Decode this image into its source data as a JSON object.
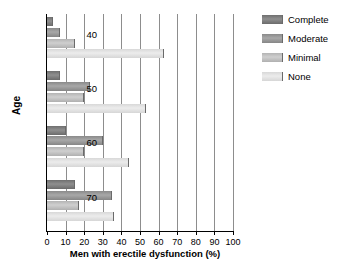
{
  "chart_data": {
    "type": "bar",
    "orientation": "horizontal",
    "title": "",
    "xlabel": "Men with erectile dysfunction (%)",
    "ylabel": "Age",
    "categories": [
      "40",
      "50",
      "60",
      "70"
    ],
    "xlim": [
      0,
      100
    ],
    "xticks": [
      0,
      10,
      20,
      30,
      40,
      50,
      60,
      70,
      80,
      90,
      100
    ],
    "xticklabels": [
      "0",
      "10",
      "20",
      "30",
      "40",
      "50",
      "60",
      "70",
      "80",
      "90",
      "100"
    ],
    "grid": "vertical",
    "legend_position": "top-right",
    "series": [
      {
        "name": "Complete",
        "color": "#808080",
        "values": [
          3,
          7,
          10,
          15
        ]
      },
      {
        "name": "Moderate",
        "color": "#9c9c9c",
        "values": [
          7,
          23,
          30,
          35
        ]
      },
      {
        "name": "Minimal",
        "color": "#c4c4c4",
        "values": [
          15,
          20,
          20,
          17
        ]
      },
      {
        "name": "None",
        "color": "#e2e2e2",
        "values": [
          63,
          53,
          44,
          36
        ]
      }
    ]
  },
  "legend": {
    "items": [
      {
        "label": "Complete"
      },
      {
        "label": "Moderate"
      },
      {
        "label": "Minimal"
      },
      {
        "label": "None"
      }
    ]
  }
}
